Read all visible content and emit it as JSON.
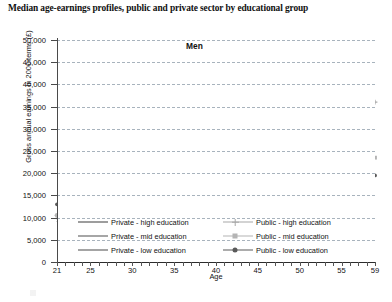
{
  "chart": {
    "title": "Median age-earnings profiles, public and private sector by educational group",
    "annotation": "Men",
    "xlabel": "Age",
    "ylabel": "Gross annual earnings in 2000 terms (£)"
  },
  "chart_data": {
    "type": "line",
    "title": "Median age-earnings profiles, public and private sector by educational group",
    "subtitle": "Men",
    "xlabel": "Age",
    "ylabel": "Gross annual earnings in 2000 terms (£)",
    "xlim": [
      21,
      59
    ],
    "ylim": [
      0,
      50000
    ],
    "ytick_labels": [
      "0",
      "5,000",
      "10,000",
      "15,000",
      "20,000",
      "25,000",
      "30,000",
      "35,000",
      "40,000",
      "45,000",
      "50,000"
    ],
    "ytick_values": [
      0,
      5000,
      10000,
      15000,
      20000,
      25000,
      30000,
      35000,
      40000,
      45000,
      50000
    ],
    "xtick_labels": [
      "21",
      "25",
      "30",
      "35",
      "40",
      "45",
      "50",
      "55",
      "59"
    ],
    "xtick_values": [
      21,
      25,
      30,
      35,
      40,
      45,
      50,
      55,
      59
    ],
    "grid": "horizontal-dashed",
    "legend_position": "bottom",
    "x": [
      21,
      22,
      23,
      24,
      25,
      26,
      27,
      28,
      29,
      30,
      31,
      32,
      33,
      34,
      35,
      36,
      37,
      38,
      39,
      40,
      41,
      42,
      43,
      44,
      45,
      46,
      47,
      48,
      49,
      50,
      51,
      52,
      53,
      54,
      55,
      56,
      57,
      58,
      59
    ],
    "series": [
      {
        "name": "Private - high education",
        "color": "#3d3d3d",
        "marker": "none",
        "values": [
          9000,
          11500,
          13500,
          15500,
          17500,
          19500,
          21500,
          23000,
          24500,
          26500,
          27000,
          29500,
          31000,
          33500,
          35500,
          37000,
          38500,
          40500,
          42500,
          46000,
          43500,
          42000,
          43000,
          41500,
          40500,
          42500,
          41000,
          40500,
          42000,
          40000,
          38500,
          41000,
          36500,
          34500,
          39000,
          33500,
          37500,
          32500,
          32000
        ]
      },
      {
        "name": "Private - mid education",
        "color": "#4f4f4f",
        "marker": "none",
        "values": [
          10000,
          12000,
          14000,
          16000,
          18000,
          19500,
          21000,
          22500,
          23500,
          24000,
          24500,
          25000,
          25500,
          25500,
          26000,
          26500,
          26500,
          27000,
          27500,
          27500,
          27500,
          27000,
          27000,
          27000,
          26500,
          26500,
          26000,
          26000,
          25500,
          25000,
          24500,
          24000,
          23500,
          23000,
          22500,
          22500,
          22500,
          22500,
          22500
        ]
      },
      {
        "name": "Private - low education",
        "color": "#4a4a4a",
        "marker": "none",
        "values": [
          9500,
          11000,
          12500,
          14000,
          15500,
          16500,
          17500,
          18500,
          19000,
          19500,
          20000,
          20500,
          21000,
          21000,
          21500,
          21500,
          22000,
          22000,
          22000,
          22000,
          22000,
          21500,
          21500,
          21500,
          21000,
          21000,
          20500,
          20000,
          19500,
          19000,
          18500,
          18500,
          18500,
          18500,
          18500,
          18500,
          18500,
          18500,
          18500
        ]
      },
      {
        "name": "Public - high education",
        "color": "#a8a8a8",
        "marker": "cross",
        "values": [
          10500,
          12000,
          14000,
          16000,
          18000,
          20000,
          21500,
          22500,
          24000,
          25000,
          24000,
          26000,
          26500,
          27500,
          28000,
          27500,
          29000,
          31000,
          33000,
          34000,
          35000,
          35500,
          36000,
          36500,
          37000,
          38000,
          38500,
          39000,
          39000,
          38000,
          37500,
          36000,
          35000,
          36500,
          38500,
          36500,
          34000,
          38000,
          36000
        ]
      },
      {
        "name": "Public - mid education",
        "color": "#b4b4b4",
        "marker": "square",
        "values": [
          10500,
          12500,
          14500,
          16500,
          18500,
          20000,
          21000,
          22000,
          22500,
          23000,
          23500,
          24000,
          25000,
          25500,
          26500,
          27500,
          27500,
          28000,
          28000,
          28500,
          28000,
          28000,
          28000,
          27500,
          27500,
          27500,
          27000,
          27000,
          26500,
          26000,
          25500,
          25000,
          24500,
          26500,
          28000,
          26500,
          25000,
          24000,
          23500
        ]
      },
      {
        "name": "Public - low education",
        "color": "#5a5a5a",
        "marker": "dot",
        "values": [
          13000,
          11500,
          13000,
          15000,
          16500,
          18000,
          19000,
          20000,
          21000,
          21500,
          22000,
          22500,
          23000,
          23000,
          23500,
          24000,
          24500,
          24500,
          24500,
          24000,
          24000,
          23500,
          23500,
          23000,
          23000,
          22500,
          22000,
          21500,
          21000,
          20000,
          19500,
          19000,
          19000,
          19000,
          19000,
          19000,
          19500,
          19500,
          19500
        ]
      }
    ]
  },
  "legend": {
    "items": [
      {
        "label": "Private - high education"
      },
      {
        "label": "Public - high education"
      },
      {
        "label": "Private - mid education"
      },
      {
        "label": "Public - mid education"
      },
      {
        "label": "Private - low education"
      },
      {
        "label": "Public - low education"
      }
    ]
  }
}
